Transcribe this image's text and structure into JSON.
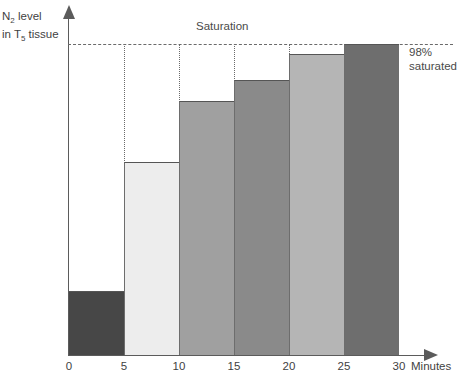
{
  "chart_data": {
    "type": "bar",
    "title": "",
    "xlabel": "Minutes",
    "ylabel": "N2 level in T5 tissue",
    "ylabel_lines": [
      "N2 level",
      "in T5 tissue"
    ],
    "grid": false,
    "legend_position": "none",
    "xlim": [
      0,
      30
    ],
    "ylim": [
      0,
      100
    ],
    "categories": [
      "0-5",
      "5-10",
      "10-15",
      "15-20",
      "20-25",
      "25-30"
    ],
    "x": [
      0,
      5,
      10,
      15,
      20,
      25,
      30
    ],
    "xtick_labels": [
      "0",
      "5",
      "10",
      "15",
      "20",
      "25",
      "30"
    ],
    "values": [
      50,
      75,
      87,
      91,
      96,
      98
    ],
    "value_unit": "% saturated",
    "bar_colors": [
      "#474747",
      "#ededed",
      "#a0a0a0",
      "#8a8a8a",
      "#b5b5b5",
      "#6e6e6e"
    ],
    "annotations": [
      {
        "name": "saturation-line-label",
        "text": "Saturation"
      },
      {
        "name": "saturation-level-label",
        "lines": [
          "98%",
          "saturated"
        ],
        "value": 98
      }
    ],
    "reference_line": {
      "label": "Saturation",
      "value": 98,
      "style": "dashed"
    }
  },
  "axes": {
    "y": {
      "label_line1_prefix": "N",
      "label_line1_sub": "2",
      "label_line1_suffix": " level",
      "label_line2_prefix": "in T",
      "label_line2_sub": "5",
      "label_line2_suffix": " tissue"
    },
    "x": {
      "title": "Minutes",
      "ticks": [
        "0",
        "5",
        "10",
        "15",
        "20",
        "25",
        "30"
      ]
    }
  },
  "labels": {
    "saturation": "Saturation",
    "saturated_pct": "98%",
    "saturated_word": "saturated"
  },
  "colors": {
    "axis": "#5b5b5b",
    "dashed_line": "#6a6a6a",
    "text": "#3f3f3f",
    "bar_outline": "#555555"
  }
}
